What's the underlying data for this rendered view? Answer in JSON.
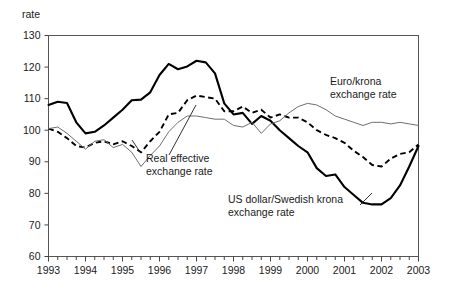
{
  "chart_data": {
    "type": "line",
    "title": "",
    "ylabel": "rate",
    "xlabel": "",
    "ylim": [
      60,
      130
    ],
    "yticks": [
      60,
      70,
      80,
      90,
      100,
      110,
      120,
      130
    ],
    "xlim": [
      1993,
      2003
    ],
    "xticks": [
      1993,
      1994,
      1995,
      1996,
      1997,
      1998,
      1999,
      2000,
      2001,
      2002,
      2003
    ],
    "xtick_labels": [
      "1993",
      "1994",
      "1995",
      "1996",
      "1997",
      "1998",
      "1999",
      "2000",
      "2001",
      "2002",
      "2003"
    ],
    "minor_tick_interval_years": 0.25,
    "grid": false,
    "legend": "annotations-inline",
    "series": [
      {
        "name": "US dollar/Swedish krona exchange rate",
        "style": "solid-bold",
        "x": [
          1993.0,
          1993.25,
          1993.5,
          1993.75,
          1994.0,
          1994.25,
          1994.5,
          1994.75,
          1995.0,
          1995.25,
          1995.5,
          1995.75,
          1996.0,
          1996.25,
          1996.5,
          1996.75,
          1997.0,
          1997.25,
          1997.5,
          1997.75,
          1998.0,
          1998.25,
          1998.5,
          1998.75,
          1999.0,
          1999.25,
          1999.5,
          1999.75,
          2000.0,
          2000.25,
          2000.5,
          2000.75,
          2001.0,
          2001.25,
          2001.5,
          2001.75,
          2002.0,
          2002.25,
          2002.5,
          2002.75,
          2003.0
        ],
        "y": [
          108.0,
          109.0,
          108.6,
          102.5,
          99.0,
          99.5,
          101.5,
          104.0,
          106.5,
          109.5,
          109.7,
          112.0,
          117.5,
          121.0,
          119.3,
          120.2,
          122.0,
          121.5,
          118.0,
          108.5,
          105.0,
          105.5,
          102.0,
          104.5,
          103.0,
          100.0,
          97.5,
          95.0,
          93.0,
          88.0,
          85.5,
          86.0,
          82.0,
          79.5,
          77.0,
          76.5,
          76.5,
          78.5,
          82.5,
          88.5,
          95.0
        ]
      },
      {
        "name": "Real effective exchange rate",
        "style": "dashed",
        "x": [
          1993.0,
          1993.25,
          1993.5,
          1993.75,
          1994.0,
          1994.25,
          1994.5,
          1994.75,
          1995.0,
          1995.25,
          1995.5,
          1995.75,
          1996.0,
          1996.25,
          1996.5,
          1996.75,
          1997.0,
          1997.25,
          1997.5,
          1997.75,
          1998.0,
          1998.25,
          1998.5,
          1998.75,
          1999.0,
          1999.25,
          1999.5,
          1999.75,
          2000.0,
          2000.25,
          2000.5,
          2000.75,
          2001.0,
          2001.25,
          2001.5,
          2001.75,
          2002.0,
          2002.25,
          2002.5,
          2002.75,
          2003.0
        ],
        "y": [
          100.5,
          99.5,
          97.5,
          95.0,
          94.5,
          96.0,
          96.5,
          95.5,
          96.5,
          95.0,
          93.0,
          96.5,
          99.5,
          105.0,
          105.5,
          109.5,
          111.0,
          110.5,
          110.0,
          106.0,
          106.0,
          107.5,
          105.5,
          106.5,
          104.0,
          105.0,
          104.0,
          104.0,
          102.5,
          100.0,
          98.5,
          97.5,
          96.0,
          93.5,
          91.5,
          89.0,
          88.5,
          91.0,
          92.5,
          93.0,
          95.5
        ]
      },
      {
        "name": "Euro/krona exchange rate",
        "style": "thin",
        "x": [
          1993.0,
          1993.25,
          1993.5,
          1993.75,
          1994.0,
          1994.25,
          1994.5,
          1994.75,
          1995.0,
          1995.25,
          1995.5,
          1995.75,
          1996.0,
          1996.25,
          1996.5,
          1996.75,
          1997.0,
          1997.25,
          1997.5,
          1997.75,
          1998.0,
          1998.25,
          1998.5,
          1998.75,
          1999.0,
          1999.25,
          1999.5,
          1999.75,
          2000.0,
          2000.25,
          2000.5,
          2000.75,
          2001.0,
          2001.25,
          2001.5,
          2001.75,
          2002.0,
          2002.25,
          2002.5,
          2002.75,
          2003.0
        ],
        "y": [
          100.5,
          101.0,
          99.0,
          96.5,
          94.0,
          96.5,
          97.0,
          94.5,
          95.5,
          93.0,
          88.5,
          92.0,
          95.0,
          99.5,
          102.5,
          104.5,
          104.5,
          104.0,
          103.5,
          103.5,
          101.5,
          101.0,
          102.5,
          99.0,
          102.0,
          103.0,
          105.5,
          107.5,
          108.5,
          108.0,
          106.5,
          104.5,
          103.5,
          102.5,
          101.5,
          102.5,
          102.5,
          102.0,
          102.5,
          102.0,
          101.5
        ]
      }
    ],
    "annotations": [
      {
        "id": "euro-krona-annotation",
        "lines": [
          "Euro/krona",
          "exchange rate"
        ],
        "x": 330,
        "y": 85
      },
      {
        "id": "real-effective-annotation",
        "lines": [
          "Real effective",
          "exchange rate"
        ],
        "x": 146,
        "y": 162
      },
      {
        "id": "us-dollar-annotation",
        "lines": [
          "US dollar/Swedish krona",
          "exchange rate"
        ],
        "x": 228,
        "y": 203
      }
    ],
    "colors": {
      "series_us_dollar": "#000000",
      "series_real_effective": "#000000",
      "series_euro_krona": "#6e6e6e",
      "axis": "#555555",
      "background": "#ffffff"
    }
  }
}
